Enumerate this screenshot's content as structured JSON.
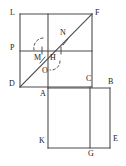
{
  "figure": {
    "stroke_color": "#4d4d4d",
    "label_color": "#1a1a1a",
    "background": "#ffffff",
    "labels": [
      {
        "key": "L",
        "text": "L",
        "x": 10,
        "y": 9
      },
      {
        "key": "F",
        "text": "F",
        "x": 95,
        "y": 9
      },
      {
        "key": "N",
        "text": "N",
        "x": 60,
        "y": 30
      },
      {
        "key": "P",
        "text": "P",
        "x": 10,
        "y": 44
      },
      {
        "key": "M",
        "text": "M",
        "x": 35,
        "y": 54
      },
      {
        "key": "H",
        "text": "H",
        "x": 51,
        "y": 54
      },
      {
        "key": "O",
        "text": "O",
        "x": 43,
        "y": 68
      },
      {
        "key": "D",
        "text": "D",
        "x": 9,
        "y": 81
      },
      {
        "key": "A",
        "text": "A",
        "x": 41,
        "y": 90
      },
      {
        "key": "C",
        "text": "C",
        "x": 87,
        "y": 75
      },
      {
        "key": "B",
        "text": "B",
        "x": 108,
        "y": 79
      },
      {
        "key": "K",
        "text": "K",
        "x": 39,
        "y": 138
      },
      {
        "key": "E",
        "text": "E",
        "x": 113,
        "y": 136
      },
      {
        "key": "G",
        "text": "G",
        "x": 89,
        "y": 150
      }
    ],
    "vertices": {
      "L": [
        20,
        14
      ],
      "F": [
        92,
        14
      ],
      "D": [
        20,
        87
      ],
      "C": [
        92,
        87
      ],
      "A": [
        48,
        88
      ],
      "B": [
        110,
        88
      ],
      "K": [
        48,
        148
      ],
      "E": [
        110,
        148
      ],
      "G": [
        90,
        148
      ],
      "P": [
        20,
        51
      ],
      "N": [
        66,
        40
      ],
      "M": [
        41,
        51
      ],
      "H": [
        48,
        58
      ],
      "O": [
        48,
        65
      ]
    },
    "segments": [
      {
        "name": "top-edge-LF",
        "from": "L",
        "to": "F"
      },
      {
        "name": "left-edge-LD",
        "from": "L",
        "to": "D"
      },
      {
        "name": "right-edge-FC",
        "from": "F",
        "to": "C"
      },
      {
        "name": "bottom-edge-DC",
        "from": "D",
        "to": "C"
      },
      {
        "name": "diagonal-DF",
        "from": "D",
        "to": "F"
      },
      {
        "name": "horizontal-PQ",
        "from": "P",
        "to": [
          92,
          51
        ]
      },
      {
        "name": "vertical-upper",
        "from": [
          48,
          14
        ],
        "to": [
          48,
          88
        ]
      },
      {
        "name": "lower-square-top-AB",
        "from": "A",
        "to": "B"
      },
      {
        "name": "lower-square-right-BE",
        "from": "B",
        "to": "E"
      },
      {
        "name": "lower-square-bottom-KE",
        "from": "K",
        "to": "E"
      },
      {
        "name": "lower-square-left-AK",
        "from": "A",
        "to": "K"
      },
      {
        "name": "vertical-lower-CG",
        "from": [
          90,
          87
        ],
        "to": "G"
      }
    ],
    "ticks": [
      {
        "name": "tick-on-PH-horizontal-left",
        "x1": 43,
        "y1": 48,
        "x2": 43,
        "y2": 54
      },
      {
        "name": "tick-on-PH-horizontal-right",
        "x1": 60,
        "y1": 48,
        "x2": 60,
        "y2": 54
      },
      {
        "name": "tick-on-diagonal-DH",
        "x1": 41,
        "y1": 62,
        "x2": 46,
        "y2": 57
      },
      {
        "name": "tick-on-diagonal-NF",
        "x1": 64,
        "y1": 44,
        "x2": 69,
        "y2": 39
      }
    ],
    "arcs": [
      {
        "name": "dashed-arc-upper-left",
        "cx": 42,
        "cy": 46,
        "r": 9,
        "a0": 200,
        "a1": 330
      },
      {
        "name": "dashed-arc-lower-right",
        "cx": 53,
        "cy": 62,
        "r": 8,
        "a0": 20,
        "a1": 150
      }
    ]
  }
}
